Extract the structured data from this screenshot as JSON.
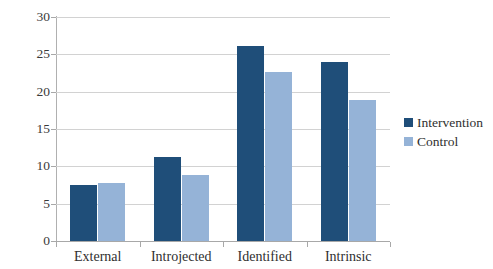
{
  "chart_data": {
    "type": "bar",
    "title": "",
    "xlabel": "",
    "ylabel": "",
    "categories": [
      "External",
      "Introjected",
      "Identified",
      "Intrinsic"
    ],
    "series": [
      {
        "name": "Intervention",
        "color": "#1f4e79",
        "values": [
          7.5,
          11.3,
          26.1,
          24.0
        ]
      },
      {
        "name": "Control",
        "color": "#95b3d7",
        "values": [
          7.8,
          8.8,
          22.6,
          18.9
        ]
      }
    ],
    "ylim": [
      0,
      30
    ],
    "yticks": [
      0,
      5,
      10,
      15,
      20,
      25,
      30
    ],
    "ytick_labels": [
      "0",
      "5",
      "10",
      "15",
      "20",
      "25",
      "30"
    ],
    "grid": true,
    "legend_position": "right"
  },
  "legend": {
    "entries": [
      {
        "label": "Intervention"
      },
      {
        "label": "Control"
      }
    ]
  }
}
